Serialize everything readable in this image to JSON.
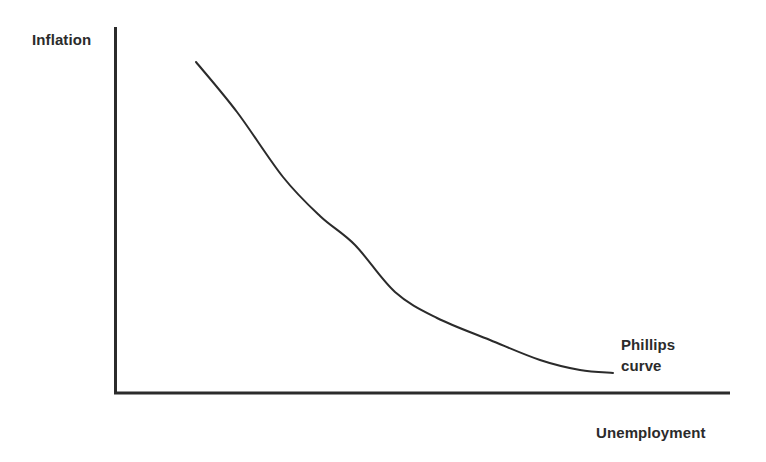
{
  "figure": {
    "background_color": "#ffffff",
    "ink_color": "#2b2b2b",
    "width": 766,
    "height": 462
  },
  "chart_data": {
    "type": "line",
    "title": "",
    "subtitle": "",
    "xlabel": "Unemployment",
    "ylabel": "Inflation",
    "grid": false,
    "legend_position": "inline-annotation",
    "axis_style": {
      "show_ticks": false,
      "show_tick_labels": false,
      "x_axis_range_px": [
        114,
        730
      ],
      "y_axis_range_px": [
        27,
        393
      ],
      "line_width_px": 3
    },
    "series": [
      {
        "name": "Phillips curve",
        "annotation": "Phillips curve",
        "annotation_lines": [
          "Phillips",
          "curve"
        ],
        "color": "#2b2b2b",
        "line_width_px": 2,
        "relationship": "downward-sloping convex (inverse relation between unemployment and inflation)",
        "points_px": [
          [
            196,
            62
          ],
          [
            237,
            112
          ],
          [
            283,
            177
          ],
          [
            320,
            216
          ],
          [
            355,
            245
          ],
          [
            395,
            292
          ],
          [
            437,
            318
          ],
          [
            490,
            340
          ],
          [
            540,
            360
          ],
          [
            580,
            370
          ],
          [
            613,
            373
          ]
        ],
        "points_normalized": [
          {
            "x": 0.13,
            "y": 0.91
          },
          {
            "x": 0.2,
            "y": 0.77
          },
          {
            "x": 0.27,
            "y": 0.59
          },
          {
            "x": 0.33,
            "y": 0.48
          },
          {
            "x": 0.39,
            "y": 0.4
          },
          {
            "x": 0.46,
            "y": 0.28
          },
          {
            "x": 0.52,
            "y": 0.2
          },
          {
            "x": 0.61,
            "y": 0.14
          },
          {
            "x": 0.69,
            "y": 0.09
          },
          {
            "x": 0.76,
            "y": 0.06
          },
          {
            "x": 0.81,
            "y": 0.05
          }
        ]
      }
    ],
    "xlim": [
      0,
      1
    ],
    "ylim": [
      0,
      1
    ]
  },
  "labels": {
    "y_axis": "Inflation",
    "x_axis": "Unemployment",
    "curve_line_1": "Phillips",
    "curve_line_2": "curve"
  }
}
